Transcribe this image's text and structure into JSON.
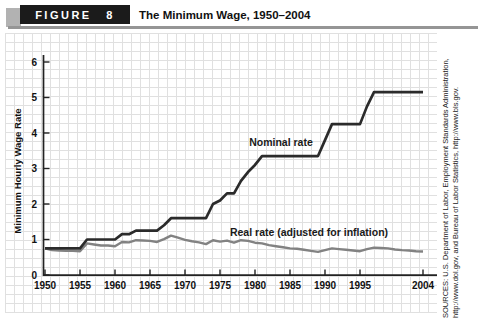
{
  "header": {
    "figure_label": "FIGURE 8",
    "title": "The Minimum Wage, 1950–2004"
  },
  "chart_data": {
    "type": "line",
    "title": "The Minimum Wage, 1950–2004",
    "xlabel": "",
    "ylabel": "Minimum Hourly Wage Rate",
    "xlim": [
      1950,
      2006
    ],
    "ylim": [
      0,
      6
    ],
    "grid": true,
    "legend_position": "inline-annotations",
    "x_ticks": [
      1950,
      1955,
      1960,
      1965,
      1970,
      1975,
      1980,
      1985,
      1990,
      1995,
      2004
    ],
    "y_ticks": [
      0,
      1,
      2,
      3,
      4,
      5,
      6
    ],
    "years": [
      1950,
      1951,
      1952,
      1953,
      1954,
      1955,
      1956,
      1957,
      1958,
      1959,
      1960,
      1961,
      1962,
      1963,
      1964,
      1965,
      1966,
      1967,
      1968,
      1969,
      1970,
      1971,
      1972,
      1973,
      1974,
      1975,
      1976,
      1977,
      1978,
      1979,
      1980,
      1981,
      1982,
      1983,
      1984,
      1985,
      1986,
      1987,
      1988,
      1989,
      1990,
      1991,
      1992,
      1993,
      1994,
      1995,
      1996,
      1997,
      1998,
      1999,
      2000,
      2001,
      2002,
      2003,
      2004
    ],
    "series": [
      {
        "name": "Nominal rate",
        "color": "#2b2b2b",
        "values": [
          0.75,
          0.75,
          0.75,
          0.75,
          0.75,
          0.75,
          1.0,
          1.0,
          1.0,
          1.0,
          1.0,
          1.15,
          1.15,
          1.25,
          1.25,
          1.25,
          1.25,
          1.4,
          1.6,
          1.6,
          1.6,
          1.6,
          1.6,
          1.6,
          2.0,
          2.1,
          2.3,
          2.3,
          2.65,
          2.9,
          3.1,
          3.35,
          3.35,
          3.35,
          3.35,
          3.35,
          3.35,
          3.35,
          3.35,
          3.35,
          3.8,
          4.25,
          4.25,
          4.25,
          4.25,
          4.25,
          4.75,
          5.15,
          5.15,
          5.15,
          5.15,
          5.15,
          5.15,
          5.15,
          5.15
        ]
      },
      {
        "name": "Real rate (adjusted for inflation)",
        "color": "#828282",
        "values": [
          0.75,
          0.7,
          0.69,
          0.68,
          0.68,
          0.67,
          0.89,
          0.86,
          0.83,
          0.83,
          0.81,
          0.93,
          0.92,
          0.98,
          0.97,
          0.96,
          0.93,
          1.01,
          1.11,
          1.05,
          0.99,
          0.95,
          0.92,
          0.87,
          0.98,
          0.94,
          0.97,
          0.91,
          0.98,
          0.96,
          0.91,
          0.89,
          0.84,
          0.81,
          0.78,
          0.75,
          0.74,
          0.71,
          0.68,
          0.65,
          0.7,
          0.75,
          0.73,
          0.71,
          0.69,
          0.67,
          0.73,
          0.77,
          0.76,
          0.75,
          0.72,
          0.7,
          0.69,
          0.67,
          0.66
        ]
      }
    ]
  },
  "sources": "SOURCES: U.S. Department of Labor, Employment Standards Administration, http://www.dol.gov, and Bureau of Labor Statistics, http://www.bls.gov."
}
